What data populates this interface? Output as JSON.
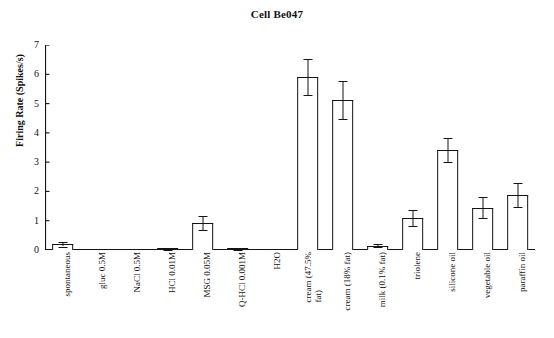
{
  "chart_data": {
    "type": "bar",
    "title": "Cell Be047",
    "xlabel": "",
    "ylabel": "Firing Rate (Spikes/s)",
    "ylim": [
      0,
      7
    ],
    "yticks": [
      0,
      1,
      2,
      3,
      4,
      5,
      6,
      7
    ],
    "grid": false,
    "legend": null,
    "orientation": "vertical",
    "bar_style": "open-outline",
    "error_bars": "SEM",
    "categories": [
      "spontaneous",
      "gluc 0.5M",
      "NaCl 0.5M",
      "HCl 0.01M",
      "MSG 0.05M",
      "Q-HCl 0.001M",
      "H2O",
      "cream (47.5% fat)",
      "cream (18% fat)",
      "milk (0.1% fat)",
      "triolene",
      "silicone oil",
      "vegetable oil",
      "paraffin oil"
    ],
    "category_lines": [
      [
        "spontaneous"
      ],
      [
        "gluc 0.5M"
      ],
      [
        "NaCl 0.5M"
      ],
      [
        "HCl 0.01M"
      ],
      [
        "MSG 0.05M"
      ],
      [
        "Q-HCl 0.001M"
      ],
      [
        "H2O"
      ],
      [
        "cream (47.5%",
        "fat)"
      ],
      [
        "cream (18% fat)"
      ],
      [
        "milk (0.1% fat)"
      ],
      [
        "triolene"
      ],
      [
        "silicone oil"
      ],
      [
        "vegetable oil"
      ],
      [
        "paraffin oil"
      ]
    ],
    "values": [
      0.19,
      0.0,
      0.0,
      0.03,
      0.92,
      0.03,
      0.0,
      5.9,
      5.12,
      0.14,
      1.1,
      3.42,
      1.45,
      1.88
    ],
    "errors": [
      0.07,
      0.0,
      0.0,
      0.02,
      0.24,
      0.02,
      0.0,
      0.62,
      0.66,
      0.05,
      0.27,
      0.42,
      0.36,
      0.42
    ],
    "colors": {
      "bar_edge": "#141414",
      "bar_fill": "#ffffff",
      "axis": "#141414",
      "text": "#111111",
      "background": "#ffffff"
    }
  }
}
